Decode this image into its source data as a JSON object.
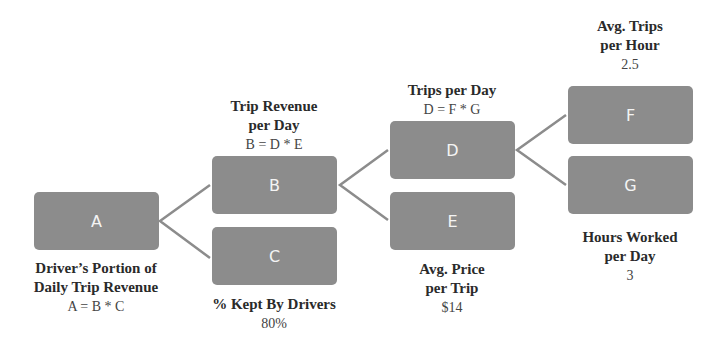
{
  "nodes": {
    "A": {
      "letter": "A",
      "title_line1": "Driver’s Portion of",
      "title_line2": "Daily Trip Revenue",
      "value": "A = B * C"
    },
    "B": {
      "letter": "B",
      "title_line1": "Trip Revenue",
      "title_line2": "per Day",
      "value": "B = D * E"
    },
    "C": {
      "letter": "C",
      "title_line1": "% Kept By Drivers",
      "value": "80%"
    },
    "D": {
      "letter": "D",
      "title_line1": "Trips per Day",
      "value": "D = F * G"
    },
    "E": {
      "letter": "E",
      "title_line1": "Avg. Price",
      "title_line2": "per Trip",
      "value": "$14"
    },
    "F": {
      "letter": "F",
      "title_line1": "Avg. Trips",
      "title_line2": "per Hour",
      "value": "2.5"
    },
    "G": {
      "letter": "G",
      "title_line1": "Hours Worked",
      "title_line2": "per Day",
      "value": "3"
    }
  },
  "colors": {
    "box": "#8c8c8c",
    "line": "#8c8c8c",
    "box_text": "#f4f4f4"
  }
}
